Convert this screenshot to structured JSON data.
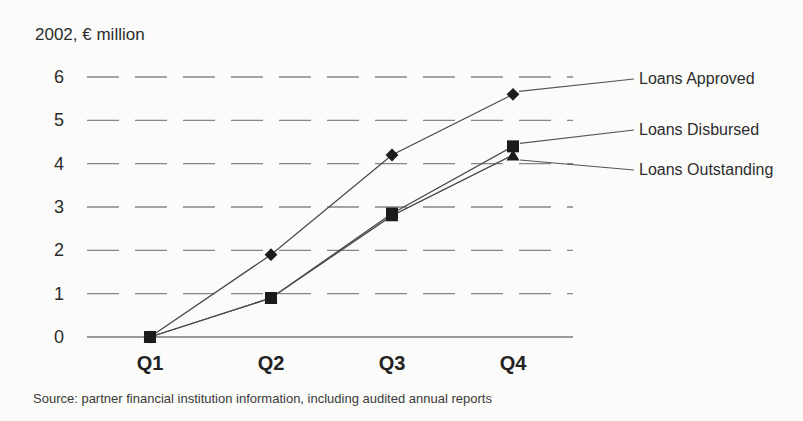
{
  "chart_data": {
    "type": "line",
    "title": "2002, € million",
    "categories": [
      "Q1",
      "Q2",
      "Q3",
      "Q4"
    ],
    "series": [
      {
        "name": "Loans Approved",
        "marker": "diamond",
        "values": [
          0,
          1.9,
          4.2,
          5.6
        ]
      },
      {
        "name": "Loans Disbursed",
        "marker": "square",
        "values": [
          0,
          0.9,
          2.85,
          4.4
        ]
      },
      {
        "name": "Loans Outstanding",
        "marker": "triangle",
        "values": [
          0,
          0.9,
          2.8,
          4.2
        ]
      }
    ],
    "yticks": [
      0,
      1,
      2,
      3,
      4,
      5,
      6
    ],
    "ylim": [
      0,
      6
    ],
    "grid": "dashed-horizontal",
    "legend_position": "right-callouts",
    "source": "Source: partner financial institution information, including audited annual reports",
    "colors": {
      "series_line": "#4a4a4a",
      "marker": "#1b1b1b",
      "gridline": "#868686",
      "axis": "#7a7a7a",
      "callout": "#555555",
      "text": "#2d2d2d"
    }
  }
}
